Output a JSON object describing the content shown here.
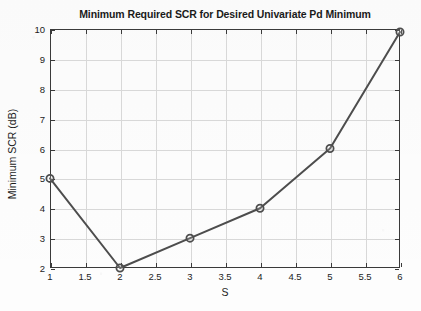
{
  "chart_data": {
    "type": "line",
    "title": "Minimum Required SCR for Desired Univariate Pd Minimum",
    "xlabel": "S",
    "ylabel": "Minimum SCR (dB)",
    "x": [
      1,
      2,
      3,
      4,
      5,
      6
    ],
    "values": [
      5,
      2,
      3,
      4,
      6,
      9.9
    ],
    "series": [
      {
        "name": "Minimum Required SCR",
        "x": [
          1,
          2,
          3,
          4,
          5,
          6
        ],
        "values": [
          5,
          2,
          3,
          4,
          6,
          9.9
        ]
      }
    ],
    "xlim": [
      1,
      6
    ],
    "ylim": [
      2,
      10
    ],
    "xticks": [
      1,
      1.5,
      2,
      2.5,
      3,
      3.5,
      4,
      4.5,
      5,
      5.5,
      6
    ],
    "xticklabels": [
      "1",
      "1.5",
      "2",
      "2.5",
      "3",
      "3.5",
      "4",
      "4.5",
      "5",
      "5.5",
      "6"
    ],
    "yticks": [
      2,
      3,
      4,
      5,
      6,
      7,
      8,
      9,
      10
    ],
    "yticklabels": [
      "2",
      "3",
      "4",
      "5",
      "6",
      "7",
      "8",
      "9",
      "10"
    ],
    "grid": true,
    "legend": null,
    "marker": "circle-open",
    "line_color": "#4d4d4d",
    "marker_edge_color": "#4d4d4d",
    "marker_face_color": "#ffffff",
    "grid_color": "#d8d8d8",
    "axis_color": "#3a3a3a",
    "background_color": "#ffffff"
  }
}
